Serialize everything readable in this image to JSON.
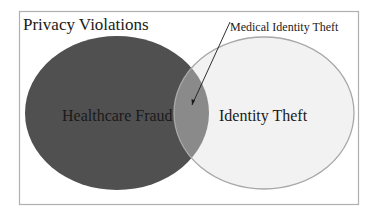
{
  "diagram": {
    "type": "venn",
    "title": "Privacy Violations",
    "sets": [
      {
        "label": "Healthcare Fraud",
        "fill": "#505050"
      },
      {
        "label": "Identity Theft",
        "fill": "#f2f2f2",
        "stroke": "#a8a8a8"
      }
    ],
    "intersection": {
      "label": "Medical Identity Theft",
      "fill": "#8a8a8a"
    },
    "colors": {
      "frame": "#b0b0b0",
      "text": "#1a1a1a",
      "background": "#ffffff"
    }
  }
}
